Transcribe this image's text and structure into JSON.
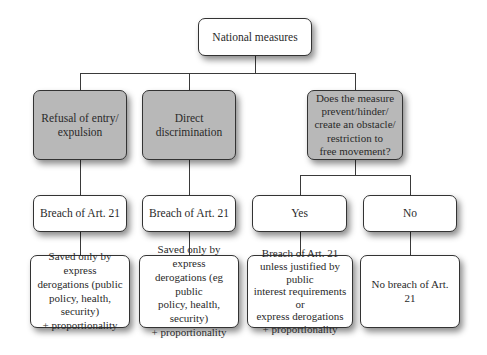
{
  "diagram": {
    "type": "flowchart",
    "colors": {
      "decision_fill": "#b8b8b8",
      "result_fill": "#ffffff",
      "line": "#3a3a3a"
    },
    "root": {
      "label": "National measures"
    },
    "level1": [
      {
        "label": "Refusal of entry/\nexpulsion"
      },
      {
        "label": "Direct\ndiscrimination"
      },
      {
        "label": "Does the measure\nprevent/hinder/\ncreate an obstacle/\nrestriction to\nfree movement?"
      }
    ],
    "level2": [
      {
        "label": "Breach of Art. 21"
      },
      {
        "label": "Breach of Art. 21"
      },
      {
        "label": "Yes"
      },
      {
        "label": "No"
      }
    ],
    "level3": [
      {
        "label": "Saved only by express\nderogations (public\npolicy, health, security)\n+ proportionality"
      },
      {
        "label": "Saved only by express\nderogations (eg public\npolicy, health, security)\n+ proportionality"
      },
      {
        "label": "Breach of Art. 21\nunless justified by public\ninterest requirements or\nexpress derogations\n+ proportionality"
      },
      {
        "label": "No breach of Art. 21"
      }
    ]
  }
}
